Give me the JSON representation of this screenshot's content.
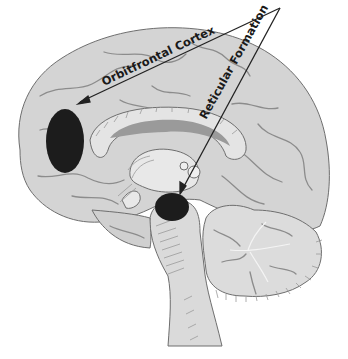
{
  "diagram": {
    "labels": [
      {
        "id": "orbitfrontal",
        "text": "Orbitfrontal Cortex"
      },
      {
        "id": "reticular",
        "text": "Reticular Formation"
      }
    ],
    "colors": {
      "brain_fill": "#d4d4d4",
      "brain_light": "#e2e2e2",
      "highlight": "#1c1c1c",
      "arrow": "#222222",
      "background": "#ffffff"
    }
  }
}
